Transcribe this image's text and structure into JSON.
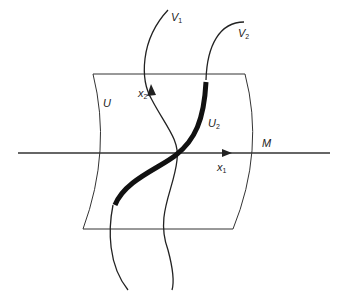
{
  "diagram": {
    "colors": {
      "stroke": "#222222",
      "background": "#ffffff"
    },
    "labels": {
      "V1": {
        "main": "V",
        "sub": "1"
      },
      "V2": {
        "main": "V",
        "sub": "2"
      },
      "x2": {
        "main": "x",
        "sub": "2"
      },
      "x1": {
        "main": "x",
        "sub": "1"
      },
      "U": {
        "main": "U"
      },
      "U2": {
        "main": "U",
        "sub": "2"
      },
      "M": {
        "main": "M"
      }
    }
  }
}
